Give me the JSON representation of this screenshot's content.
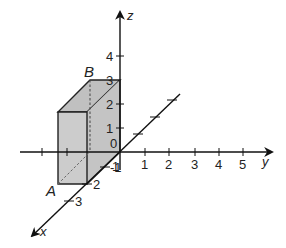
{
  "diagram": {
    "type": "3d-coordinate-axes-with-box",
    "axes": {
      "x": {
        "label": "x",
        "ticks": [
          "1",
          "2",
          "3"
        ]
      },
      "y": {
        "label": "y",
        "ticks": [
          "1",
          "2",
          "3",
          "4",
          "5"
        ]
      },
      "z": {
        "label": "z",
        "ticks": [
          "1",
          "2",
          "3",
          "4"
        ]
      },
      "origin_label": "0",
      "neg_z_label": "-1"
    },
    "points": {
      "A": "A",
      "B": "B"
    },
    "box": {
      "fill": "#c8c8c8",
      "edge": "#222222",
      "description": "rectangular box with one vertex at origin, extending to x=2, y=-1 (toward negative y), z=3"
    },
    "colors": {
      "axis": "#111111",
      "box_fill": "#c8c8c8",
      "hidden_edge": "#444444"
    }
  }
}
